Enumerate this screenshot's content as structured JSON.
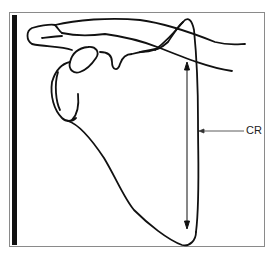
{
  "figure": {
    "labels": {
      "cr": "CR"
    },
    "colors": {
      "line": "#111111",
      "frame": "#8a8a8a",
      "background": "#ffffff",
      "bar": "#111111"
    }
  }
}
